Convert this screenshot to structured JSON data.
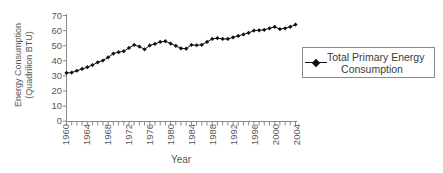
{
  "chart_data": {
    "type": "line",
    "title": "",
    "xlabel": "Year",
    "ylabel_line1": "Energy Consumption",
    "ylabel_line2": "(Quadrilion BTU)",
    "xlim": [
      1960,
      2004
    ],
    "ylim": [
      0,
      70
    ],
    "grid": false,
    "legend_position": "right",
    "ytick_labels": [
      "70",
      "60",
      "50",
      "40",
      "30",
      "20",
      "10",
      "0"
    ],
    "ytick_values": [
      70,
      60,
      50,
      40,
      30,
      20,
      10,
      0
    ],
    "xtick_labels": [
      "1960",
      "1964",
      "1968",
      "1972",
      "1976",
      "1980",
      "1984",
      "1988",
      "1992",
      "1996",
      "2000",
      "2004"
    ],
    "xtick_values": [
      1960,
      1964,
      1968,
      1972,
      1976,
      1980,
      1984,
      1988,
      1992,
      1996,
      2000,
      2004
    ],
    "minor_tick_interval": 1,
    "series": [
      {
        "name": "Total Primary Energy Consumption",
        "marker": "diamond",
        "color": "#111111",
        "x": [
          1960,
          1961,
          1962,
          1963,
          1964,
          1965,
          1966,
          1967,
          1968,
          1969,
          1970,
          1971,
          1972,
          1973,
          1974,
          1975,
          1976,
          1977,
          1978,
          1979,
          1980,
          1981,
          1982,
          1983,
          1984,
          1985,
          1986,
          1987,
          1988,
          1989,
          1990,
          1991,
          1992,
          1993,
          1994,
          1995,
          1996,
          1997,
          1998,
          1999,
          2000,
          2001,
          2002,
          2003,
          2004
        ],
        "values": [
          32.0,
          32.2,
          33.4,
          34.6,
          35.8,
          37.2,
          39.0,
          40.2,
          42.3,
          44.8,
          45.7,
          46.4,
          48.5,
          50.5,
          49.4,
          47.6,
          50.2,
          51.2,
          52.5,
          53.0,
          51.4,
          49.9,
          48.2,
          48.0,
          50.5,
          50.3,
          50.6,
          52.5,
          54.5,
          55.0,
          54.5,
          54.5,
          55.5,
          56.5,
          57.5,
          58.5,
          60.0,
          60.2,
          60.5,
          61.5,
          62.5,
          61.0,
          61.5,
          62.5,
          64.0
        ],
        "unit": "Quadrillion BTU"
      }
    ]
  },
  "legend": {
    "entries": [
      {
        "label_line1": "Total Primary Energy",
        "label_line2": "Consumption"
      }
    ]
  }
}
